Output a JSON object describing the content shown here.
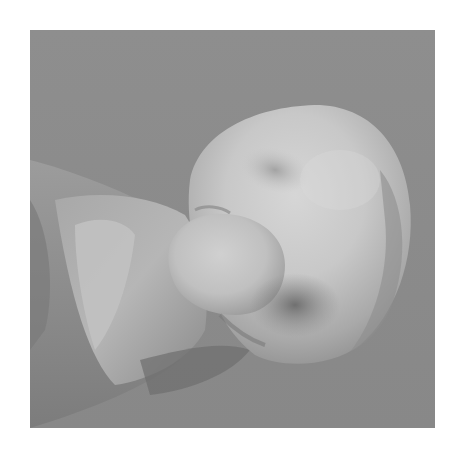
{
  "image": {
    "description": "Grayscale close-up photograph of a smooth, rounded, lobed object (tooth-like form) protruding from a cylindrical base on the left, against a plain gray background",
    "style": "grayscale photograph",
    "colors": {
      "page_background": "#ffffff",
      "photo_background": "#8b8b8b",
      "object_highlight": "#d2d2d2",
      "object_midtone": "#b4b4b4",
      "object_shadow": "#6f6f6f",
      "base_tone": "#9a9a9a"
    }
  }
}
